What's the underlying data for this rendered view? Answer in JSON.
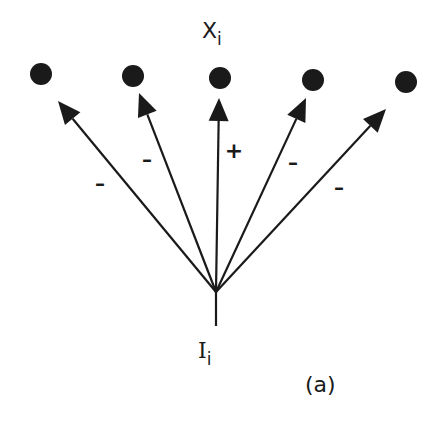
{
  "figure": {
    "panel_label": "(a)",
    "output_node_label": {
      "base": "X",
      "subscript": "i"
    },
    "input_node_label": {
      "base": "I",
      "subscript": "i"
    },
    "colors": {
      "ink": "#1a1a1a",
      "background": "#ffffff"
    }
  },
  "nodes": [
    {
      "id": "x1",
      "cx": 41,
      "cy": 74,
      "r": 11
    },
    {
      "id": "x2",
      "cx": 133,
      "cy": 76,
      "r": 11
    },
    {
      "id": "x3",
      "cx": 220,
      "cy": 78,
      "r": 11
    },
    {
      "id": "x4",
      "cx": 313,
      "cy": 80,
      "r": 11
    },
    {
      "id": "x5",
      "cx": 406,
      "cy": 82,
      "r": 11
    }
  ],
  "source": {
    "x": 216,
    "y": 292,
    "stem_end_y": 326
  },
  "arrows": [
    {
      "to": "x1",
      "tip_x": 58,
      "tip_y": 101,
      "sign": "–",
      "sign_x": 100,
      "sign_y": 183
    },
    {
      "to": "x2",
      "tip_x": 139,
      "tip_y": 93,
      "sign": "–",
      "sign_x": 147,
      "sign_y": 159
    },
    {
      "to": "x3",
      "tip_x": 219,
      "tip_y": 98,
      "sign": "+",
      "sign_x": 234,
      "sign_y": 151
    },
    {
      "to": "x4",
      "tip_x": 306,
      "tip_y": 98,
      "sign": "–",
      "sign_x": 293,
      "sign_y": 162
    },
    {
      "to": "x5",
      "tip_x": 386,
      "tip_y": 109,
      "sign": "–",
      "sign_x": 339,
      "sign_y": 187
    }
  ]
}
